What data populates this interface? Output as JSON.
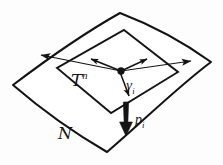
{
  "figure": {
    "background_color": "#fdfdfd",
    "stroke_color": "#141414",
    "labels": {
      "tangent_space": {
        "base": "T",
        "superscript": "n",
        "full": "T^n"
      },
      "manifold": {
        "base": "N",
        "full": "N"
      },
      "vector_v": {
        "base": "v",
        "subscript": "i",
        "full": "v_i"
      },
      "vector_p": {
        "base": "p",
        "subscript": "i",
        "full": "p_i"
      }
    },
    "geometry": {
      "manifold_surface": {
        "name": "curved-quadrilateral",
        "apex_top": [
          120,
          13
        ],
        "vertex_right": [
          211,
          62
        ],
        "vertex_bottom": [
          107,
          152
        ],
        "vertex_left": [
          13,
          85
        ]
      },
      "tangent_plane": {
        "name": "parallelogram",
        "vertex_top": [
          124,
          30
        ],
        "vertex_right": [
          178,
          72
        ],
        "vertex_bottom": [
          111,
          113
        ],
        "vertex_left": [
          57,
          68
        ]
      },
      "origin_point": [
        121,
        71
      ],
      "arrows": [
        {
          "name": "basis-vector-left",
          "from": [
            121,
            71
          ],
          "to": [
            36,
            54
          ]
        },
        {
          "name": "basis-vector-right",
          "from": [
            121,
            71
          ],
          "to": [
            196,
            61
          ]
        },
        {
          "name": "basis-vector-inner-left",
          "from": [
            121,
            71
          ],
          "to": [
            88,
            58
          ]
        },
        {
          "name": "basis-vector-inner-right",
          "from": [
            121,
            71
          ],
          "to": [
            150,
            58
          ]
        },
        {
          "name": "tangent-vector-v",
          "from": [
            121,
            71
          ],
          "to": [
            131,
            100
          ]
        },
        {
          "name": "normal-vector-p",
          "from": [
            126,
            103
          ],
          "to": [
            126,
            134
          ]
        }
      ]
    }
  }
}
